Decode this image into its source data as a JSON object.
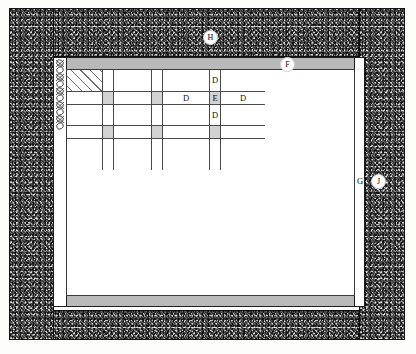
{
  "colors": {
    "masonry_dark": "#4a4a4a",
    "band_fill": "#b9b9b9",
    "panel_fill": "#ffffff",
    "pillar_fill": "#d2d2d2",
    "line": "#4a4a4a",
    "outline": "#141414",
    "text": "#111111"
  },
  "callouts": [
    {
      "id": "H",
      "label": "H",
      "style": "circled",
      "target": "upper masonry wall"
    },
    {
      "id": "F",
      "label": "F",
      "style": "circled",
      "target": "top lintel band"
    },
    {
      "id": "G",
      "label": "G",
      "style": "plain",
      "target": "right vertical post"
    },
    {
      "id": "J",
      "label": "J",
      "style": "circled",
      "target": "right masonry wall"
    }
  ],
  "grid": {
    "columns": 7,
    "rows": 5,
    "column_widths": [
      36,
      11,
      38,
      11,
      47,
      11,
      44
    ],
    "row_heights": [
      22,
      13,
      21,
      13,
      31
    ],
    "cells": [
      [
        {
          "label": "",
          "fill": "hatched"
        },
        {
          "label": "",
          "fill": "white"
        },
        {
          "label": "",
          "fill": "white"
        },
        {
          "label": "",
          "fill": "white"
        },
        {
          "label": "",
          "fill": "white"
        },
        {
          "label": "D",
          "fill": "white"
        },
        {
          "label": "",
          "fill": "white"
        }
      ],
      [
        {
          "label": "",
          "fill": "white"
        },
        {
          "label": "",
          "fill": "shaded"
        },
        {
          "label": "",
          "fill": "white"
        },
        {
          "label": "",
          "fill": "shaded"
        },
        {
          "label": "D",
          "fill": "white"
        },
        {
          "label": "E",
          "fill": "shaded"
        },
        {
          "label": "D",
          "fill": "white"
        }
      ],
      [
        {
          "label": "",
          "fill": "white"
        },
        {
          "label": "",
          "fill": "white"
        },
        {
          "label": "",
          "fill": "white"
        },
        {
          "label": "",
          "fill": "white"
        },
        {
          "label": "",
          "fill": "white"
        },
        {
          "label": "D",
          "fill": "white"
        },
        {
          "label": "",
          "fill": "white"
        }
      ],
      [
        {
          "label": "",
          "fill": "white"
        },
        {
          "label": "",
          "fill": "shaded"
        },
        {
          "label": "",
          "fill": "white"
        },
        {
          "label": "",
          "fill": "shaded"
        },
        {
          "label": "",
          "fill": "white"
        },
        {
          "label": "",
          "fill": "shaded"
        },
        {
          "label": "",
          "fill": "white"
        }
      ],
      [
        {
          "label": "",
          "fill": "white"
        },
        {
          "label": "",
          "fill": "white"
        },
        {
          "label": "",
          "fill": "white"
        },
        {
          "label": "",
          "fill": "white"
        },
        {
          "label": "",
          "fill": "white"
        },
        {
          "label": "",
          "fill": "white"
        },
        {
          "label": "",
          "fill": "white"
        }
      ]
    ]
  },
  "elements": {
    "masonry_left": "left masonry wall",
    "masonry_right": "right masonry wall",
    "masonry_top": "upper masonry wall",
    "masonry_bottom": "lower masonry wall",
    "band_top": "top lintel band",
    "band_bottom": "bottom sill band",
    "post_left": "left vertical post",
    "post_right": "right vertical post",
    "chain_texture": "twisted cable texture"
  }
}
